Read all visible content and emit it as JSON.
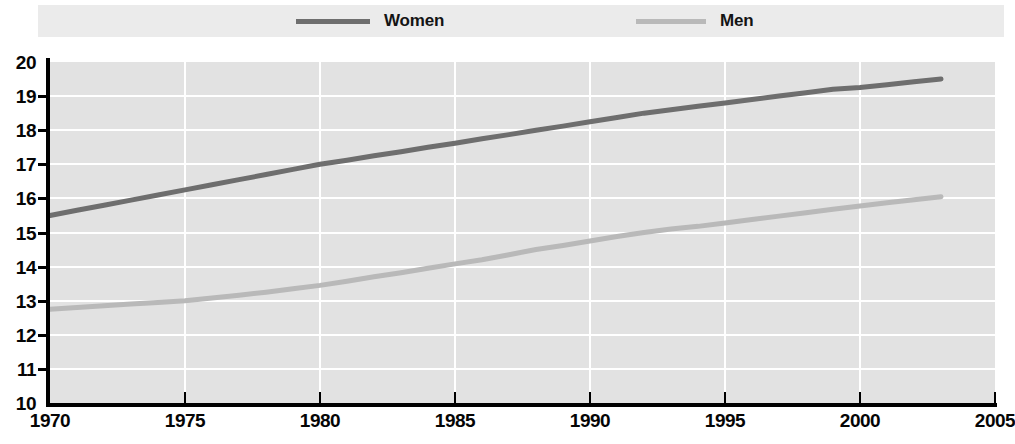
{
  "legend": {
    "entries": [
      {
        "label": "Women",
        "color": "#6e6e6e",
        "key": "women"
      },
      {
        "label": "Men",
        "color": "#b9b9b9",
        "key": "men"
      }
    ]
  },
  "axes": {
    "y_ticks": [
      "20",
      "19",
      "18",
      "17",
      "16",
      "15",
      "14",
      "13",
      "12",
      "11",
      "10"
    ],
    "x_ticks": [
      "1970",
      "1975",
      "1980",
      "1985",
      "1990",
      "1995",
      "2000",
      "2005"
    ]
  },
  "footnote": {
    "text": ""
  },
  "chart_data": {
    "type": "line",
    "title": "",
    "subtitle": "",
    "xlabel": "",
    "ylabel": "",
    "xlim": [
      1970,
      2005
    ],
    "ylim": [
      10,
      20
    ],
    "ytick_step": 1,
    "xtick_step": 5,
    "grid": true,
    "grid_color": "#ffffff",
    "plot_background": "#e2e2e2",
    "legend_position": "top",
    "x": [
      1970,
      1971,
      1972,
      1973,
      1974,
      1975,
      1976,
      1977,
      1978,
      1979,
      1980,
      1981,
      1982,
      1983,
      1984,
      1985,
      1986,
      1987,
      1988,
      1989,
      1990,
      1991,
      1992,
      1993,
      1994,
      1995,
      1996,
      1997,
      1998,
      1999,
      2000,
      2001,
      2002,
      2003
    ],
    "series": [
      {
        "name": "Women",
        "color": "#6e6e6e",
        "values": [
          15.5,
          15.65,
          15.8,
          15.95,
          16.1,
          16.25,
          16.4,
          16.55,
          16.7,
          16.85,
          17.0,
          17.12,
          17.25,
          17.37,
          17.5,
          17.62,
          17.75,
          17.87,
          18.0,
          18.12,
          18.25,
          18.37,
          18.5,
          18.6,
          18.7,
          18.8,
          18.9,
          19.0,
          19.1,
          19.2,
          19.25,
          19.33,
          19.42,
          19.5
        ]
      },
      {
        "name": "Men",
        "color": "#b9b9b9",
        "values": [
          12.75,
          12.8,
          12.85,
          12.9,
          12.95,
          13.0,
          13.08,
          13.16,
          13.25,
          13.35,
          13.45,
          13.57,
          13.7,
          13.82,
          13.95,
          14.08,
          14.2,
          14.35,
          14.5,
          14.62,
          14.75,
          14.88,
          15.0,
          15.1,
          15.18,
          15.28,
          15.38,
          15.48,
          15.58,
          15.68,
          15.78,
          15.87,
          15.96,
          16.05
        ]
      }
    ]
  }
}
